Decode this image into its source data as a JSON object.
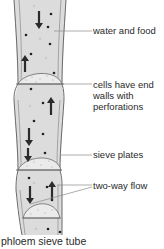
{
  "diagram": {
    "title": "phloem sieve tube",
    "labels": {
      "water_and_food": "water and food",
      "end_walls_line1": "cells have end",
      "end_walls_line2": "walls with",
      "end_walls_line3": "perforations",
      "sieve_plates": "sieve plates",
      "two_way_flow": "two-way flow"
    },
    "colors": {
      "cell_fill": "#dcdcdc",
      "cell_outline": "#6a6a6a",
      "sieve_plate_fill": "#ebebeb",
      "arrow": "#2b2b2b",
      "dot": "#222222",
      "leader_line": "#8a8a8a",
      "text": "#2a2a2a"
    },
    "cells": 4,
    "arrows": [
      {
        "cell": 1,
        "direction": "down"
      },
      {
        "cell": 1,
        "direction": "up"
      },
      {
        "cell": 2,
        "direction": "up"
      },
      {
        "cell": 2,
        "direction": "down"
      },
      {
        "cell": 3,
        "direction": "down"
      },
      {
        "cell": 4,
        "direction": "up"
      },
      {
        "cell": 4,
        "direction": "down"
      }
    ]
  }
}
